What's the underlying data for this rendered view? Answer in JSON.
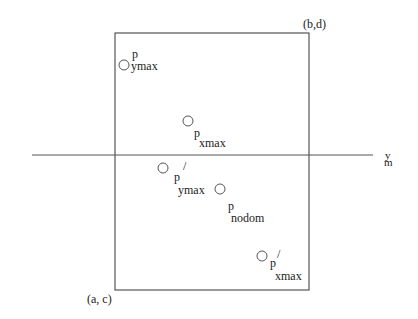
{
  "diagram": {
    "rectangle": {
      "top_right_label": "(b,d)",
      "bottom_left_label": "(a, c)"
    },
    "horizontal_line": {
      "label_main": "y",
      "label_sub": "m"
    },
    "points": [
      {
        "id": "p_ymax",
        "base": "p",
        "sub": "ymax",
        "prime": ""
      },
      {
        "id": "p_xmax",
        "base": "p",
        "sub": "xmax",
        "prime": ""
      },
      {
        "id": "p_ymax_prime",
        "base": "p",
        "sub": "ymax",
        "prime": "/"
      },
      {
        "id": "p_nodom",
        "base": "p",
        "sub": "nodom",
        "prime": ""
      },
      {
        "id": "p_xmax_prime",
        "base": "p",
        "sub": "xmax",
        "prime": "/"
      }
    ],
    "colors": {
      "stroke": "#555555",
      "text": "#222222",
      "background": "#ffffff"
    }
  }
}
